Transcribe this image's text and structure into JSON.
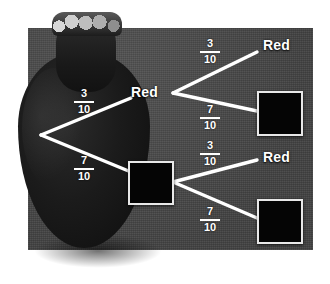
{
  "diagram": {
    "background_color": "#4a4a4a",
    "line_color": "#ffffff",
    "bag": {
      "label": "bag-illustration"
    },
    "root": {
      "name": "bag-root-node"
    },
    "branches": [
      {
        "id": "b1",
        "label_num": "3",
        "label_den": "10",
        "from": "root",
        "to": "red-level1"
      },
      {
        "id": "b2",
        "label_num": "7",
        "label_den": "10",
        "from": "root",
        "to": "black-level1"
      },
      {
        "id": "b3",
        "label_num": "3",
        "label_den": "10",
        "from": "red-level1",
        "to": "red-top"
      },
      {
        "id": "b4",
        "label_num": "7",
        "label_den": "10",
        "from": "red-level1",
        "to": "black-top"
      },
      {
        "id": "b5",
        "label_num": "3",
        "label_den": "10",
        "from": "black-level1",
        "to": "red-bottom"
      },
      {
        "id": "b6",
        "label_num": "7",
        "label_den": "10",
        "from": "black-level1",
        "to": "black-bottom"
      }
    ],
    "nodes": [
      {
        "id": "red-level1",
        "type": "text",
        "label": "Red"
      },
      {
        "id": "black-level1",
        "type": "square",
        "label": ""
      },
      {
        "id": "red-top",
        "type": "text",
        "label": "Red"
      },
      {
        "id": "black-top",
        "type": "square",
        "label": ""
      },
      {
        "id": "red-bottom",
        "type": "text",
        "label": "Red"
      },
      {
        "id": "black-bottom",
        "type": "square",
        "label": ""
      }
    ]
  }
}
